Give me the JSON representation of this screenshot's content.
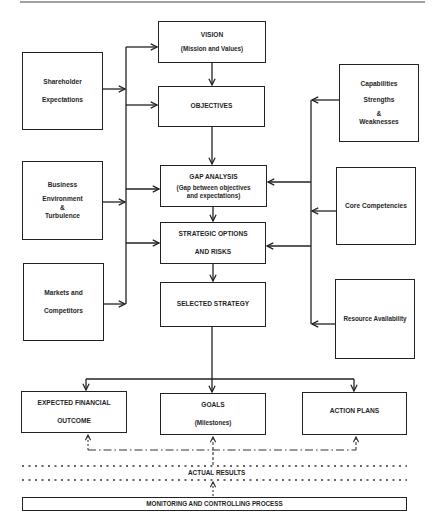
{
  "diagram": {
    "top_rule": true,
    "center_column": {
      "vision": {
        "title": "VISION",
        "subtitle": "(Mission and Values)"
      },
      "objectives": {
        "title": "OBJECTIVES"
      },
      "gap_analysis": {
        "title": "GAP ANALYSIS",
        "subtitle_line1": "(Gap between objectives",
        "subtitle_line2": "and expectations)"
      },
      "strategic_options": {
        "line1": "STRATEGIC OPTIONS",
        "line2": "AND RISKS"
      },
      "selected_strategy": {
        "title": "SELECTED STRATEGY"
      }
    },
    "left_column": {
      "shareholder": {
        "line1": "Shareholder",
        "line2": "Expectations"
      },
      "business": {
        "line1": "Business",
        "line2": "Environment",
        "line3": "&",
        "line4": "Turbulence"
      },
      "markets": {
        "line1": "Markets and",
        "line2": "Competitors"
      }
    },
    "right_column": {
      "capabilities": {
        "line1": "Capabilities",
        "line2": "Strengths",
        "line3": "&",
        "line4": "Weaknesses"
      },
      "core_competencies": {
        "title": "Core Competencies"
      },
      "resource_availability": {
        "title": "Resource Availability"
      }
    },
    "outputs": {
      "expected_financial_outcome": {
        "line1": "EXPECTED FINANCIAL",
        "line2": "OUTCOME"
      },
      "goals": {
        "title": "GOALS",
        "subtitle": "(Milestones)"
      },
      "action_plans": {
        "title": "ACTION PLANS"
      }
    },
    "feedback": {
      "actual_results": "ACTUAL RESULTS",
      "monitoring": "MONITORING AND CONTROLLING PROCESS"
    },
    "colors": {
      "line": "#222222",
      "text": "#1f1f1f",
      "background": "#ffffff"
    }
  }
}
